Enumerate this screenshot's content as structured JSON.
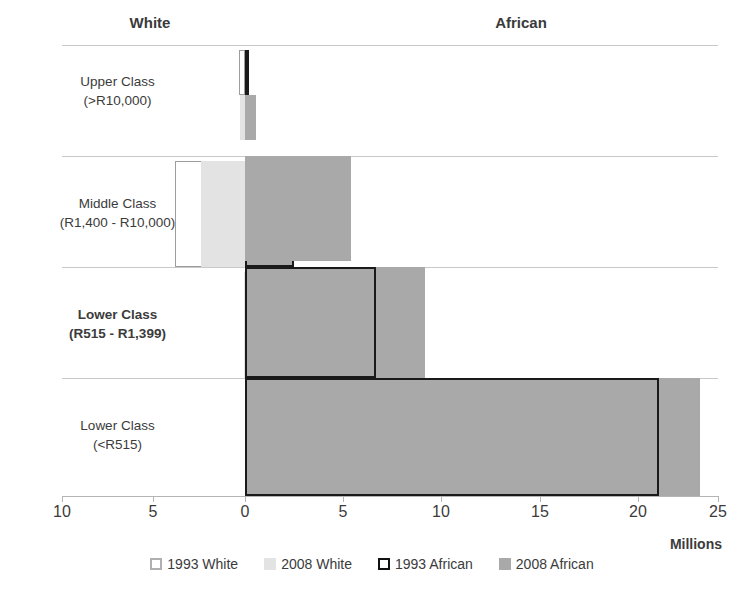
{
  "headers": {
    "left_group": "White",
    "right_group": "African"
  },
  "axis": {
    "unit_label": "Millions",
    "ticks": [
      {
        "label": "10",
        "value": -10,
        "x": 62
      },
      {
        "label": "5",
        "value": -5,
        "x": 153
      },
      {
        "label": "0",
        "value": 0,
        "x": 245
      },
      {
        "label": "5",
        "value": 5,
        "x": 343
      },
      {
        "label": "10",
        "value": 10,
        "x": 441
      },
      {
        "label": "15",
        "value": 15,
        "x": 540
      },
      {
        "label": "20",
        "value": 20,
        "x": 638
      },
      {
        "label": "25",
        "value": 25,
        "x": 718
      }
    ]
  },
  "legend": [
    {
      "label": "1993 White",
      "swatch": "sw-1993-white"
    },
    {
      "label": "2008 White",
      "swatch": "sw-2008-white"
    },
    {
      "label": "1993 African",
      "swatch": "sw-1993-african"
    },
    {
      "label": "2008 African",
      "swatch": "sw-2008-african"
    }
  ],
  "categories": [
    {
      "line1": "Upper Class",
      "line2": "(>R10,000)",
      "bold": false
    },
    {
      "line1": "Middle Class",
      "line2": "(R1,400 - R10,000)",
      "bold": false
    },
    {
      "line1": "Lower Class",
      "line2": "(R515 - R1,399)",
      "bold": true
    },
    {
      "line1": "Lower Class",
      "line2": "(<R515)",
      "bold": false
    }
  ],
  "colors": {
    "bar_1993_white_fill": "#ffffff",
    "bar_1993_white_border": "#9d9d9d",
    "bar_2008_white_fill": "#e3e3e3",
    "bar_1993_african_fill": "#a9a9a9",
    "bar_1993_african_border": "#1a1a1a",
    "bar_2008_african_fill": "#a9a9a9",
    "gridline": "#c9c9c9",
    "text": "#3b3b3b"
  },
  "chart_data": {
    "type": "bar",
    "orientation": "horizontal",
    "title": "",
    "subtitle": "",
    "xlabel": "Millions",
    "ylabel": "",
    "xlim": [
      -10,
      25
    ],
    "note": "Left of zero is the White population axis (reads 10 to 0), right of zero is the African population axis (reads 0 to 25). All values in millions of people.",
    "grid": true,
    "legend_position": "bottom",
    "categories": [
      "Upper Class (>R10,000)",
      "Middle Class (R1,400 - R10,000)",
      "Lower Class (R515 - R1,399)",
      "Lower Class (<R515)"
    ],
    "series": [
      {
        "name": "1993 White",
        "side": "left",
        "values": [
          0.35,
          3.8,
          0.0,
          0.0
        ]
      },
      {
        "name": "2008 White",
        "side": "left",
        "values": [
          0.25,
          2.4,
          0.05,
          0.0
        ]
      },
      {
        "name": "1993 African",
        "side": "right",
        "values": [
          0.1,
          2.5,
          6.7,
          21.1
        ]
      },
      {
        "name": "2008 African",
        "side": "right",
        "values": [
          0.55,
          5.4,
          9.2,
          23.2
        ]
      }
    ]
  }
}
